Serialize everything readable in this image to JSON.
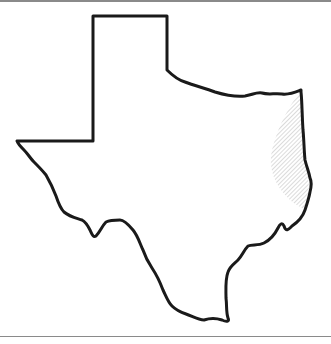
{
  "map": {
    "region": "Texas",
    "style": "outline",
    "outline_color": "#1a1a1a",
    "background_color": "#ffffff",
    "rule_color": "#8a8a8a",
    "highlight": {
      "area": "East Texas",
      "pattern": "diagonal-hatch",
      "color": "#b8b8b8"
    }
  }
}
